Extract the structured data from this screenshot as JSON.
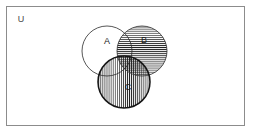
{
  "diagram": {
    "kind": "venn-diagram",
    "title": "",
    "universe": {
      "label": "U",
      "label_x": 21,
      "label_y": 20,
      "rect": {
        "x": 6,
        "y": 6,
        "width": 239,
        "height": 120
      },
      "border_color": "#8c8c8c",
      "fill_color": "#ffffff"
    },
    "sets": [
      {
        "id": "A",
        "label": "A",
        "cx": 107,
        "cy": 51,
        "r": 25,
        "fill_pattern": "none",
        "stroke_color": "#2b2b2b",
        "stroke_width": 0.8,
        "label_x": 107,
        "label_y": 42
      },
      {
        "id": "B",
        "label": "B",
        "cx": 142,
        "cy": 51,
        "r": 25,
        "fill_pattern": "horizontal-lines",
        "stroke_color": "#2b2b2b",
        "stroke_width": 0.8,
        "label_x": 144,
        "label_y": 41
      },
      {
        "id": "C",
        "label": "C",
        "cx": 124,
        "cy": 82,
        "r": 26,
        "fill_pattern": "vertical-lines",
        "stroke_color": "#151515",
        "stroke_width": 1.5,
        "label_x": 128,
        "label_y": 88
      }
    ],
    "shaded_regions": [
      {
        "name": "B-only",
        "pattern": "horizontal-lines"
      },
      {
        "name": "A-and-B",
        "pattern": "horizontal-lines"
      },
      {
        "name": "C-only",
        "pattern": "vertical-lines"
      },
      {
        "name": "A-and-C",
        "pattern": "vertical-lines"
      },
      {
        "name": "B-and-C",
        "pattern": "cross-hatch"
      },
      {
        "name": "A-and-B-and-C",
        "pattern": "cross-hatch"
      }
    ],
    "unshaded_regions": [
      {
        "name": "A-only"
      },
      {
        "name": "outside-all-sets"
      }
    ],
    "colors": {
      "line": "#2b2b2b",
      "hatch": "#1f1f1f",
      "frame": "#8c8c8c",
      "background": "#ffffff"
    }
  }
}
